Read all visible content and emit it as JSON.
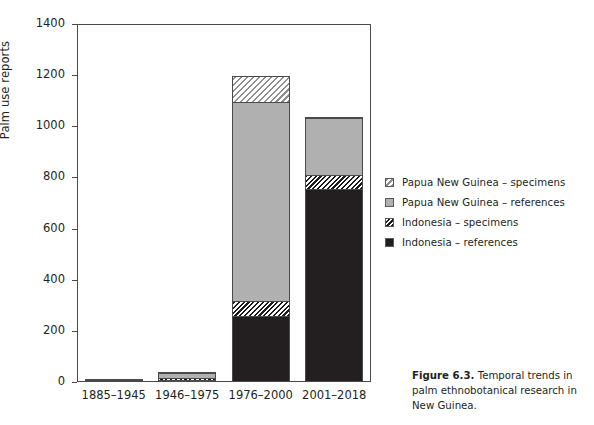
{
  "figure": {
    "caption_label": "Figure 6.3.",
    "caption_text": "Temporal trends in palm ethnobotanical research in New Guinea."
  },
  "legend": {
    "items": [
      {
        "label": "Papua New Guinea – specimens",
        "swatch": "light-hatched",
        "color": "#8f8f8f"
      },
      {
        "label": "Papua New Guinea – references",
        "swatch": "light-solid",
        "color": "#b0b0b0"
      },
      {
        "label": "Indonesia – specimens",
        "swatch": "dark-hatched",
        "color": "#1a1a1a"
      },
      {
        "label": "Indonesia – references",
        "swatch": "dark-solid",
        "color": "#231f20"
      }
    ]
  },
  "chart_data": {
    "type": "bar",
    "subtype": "stacked",
    "title": "",
    "xlabel": "",
    "ylabel": "Palm use reports",
    "categories": [
      "1885–1945",
      "1946–1975",
      "1976–2000",
      "2001–2018"
    ],
    "ylim": [
      0,
      1400
    ],
    "yticks": [
      0,
      200,
      400,
      600,
      800,
      1000,
      1200,
      1400
    ],
    "ytick_labels": [
      "0",
      "200",
      "400",
      "600",
      "800",
      "1000",
      "1200",
      "1400"
    ],
    "grid": false,
    "legend_position": "right",
    "series": [
      {
        "name": "Indonesia – references",
        "values": [
          2,
          5,
          254,
          751
        ]
      },
      {
        "name": "Indonesia – specimens",
        "values": [
          1,
          6,
          59,
          55
        ]
      },
      {
        "name": "Papua New Guinea – references",
        "values": [
          9,
          22,
          778,
          227
        ]
      },
      {
        "name": "Papua New Guinea – specimens",
        "values": [
          1,
          5,
          106,
          2
        ]
      }
    ],
    "totals": [
      13,
      38,
      1197,
      1035
    ]
  }
}
